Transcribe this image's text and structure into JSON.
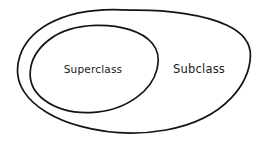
{
  "diagram": {
    "type": "euler-diagram",
    "style": "hand-drawn sketch",
    "background_color": "#ffffff",
    "ink_color": "#141414",
    "text_color": "#1a1a1a",
    "title": "",
    "regions": [
      {
        "id": "outer",
        "shape": "ellipse",
        "label": "Subclass",
        "label_position": "right-crescent",
        "contains": [
          "inner"
        ],
        "center": [
          134,
          71
        ],
        "rx": 116,
        "ry": 61
      },
      {
        "id": "inner",
        "shape": "ellipse",
        "label": "Superclass",
        "label_position": "center",
        "contained_by": "outer",
        "center": [
          94,
          69
        ],
        "rx": 64,
        "ry": 44
      }
    ],
    "labels": {
      "superclass": "Superclass",
      "subclass": "Subclass"
    }
  }
}
